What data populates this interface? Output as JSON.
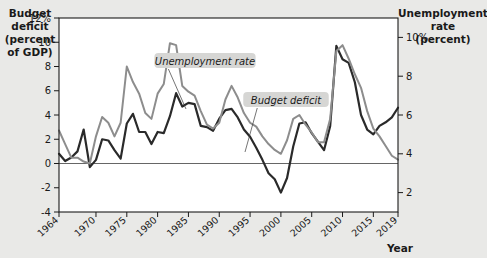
{
  "chart_data": {
    "type": "line",
    "title": "",
    "xlabel": "Year",
    "ylabel_left": "Budget deficit (percent of GDP)",
    "ylabel_right": "Unemployment rate (percent)",
    "xlim": [
      1964,
      2019
    ],
    "ylim_left": [
      -4,
      12
    ],
    "ylim_right": [
      1,
      11
    ],
    "grid": false,
    "legend_position": "inline-annotations",
    "x_tick_labels": [
      "1964",
      "1970",
      "1975",
      "1980",
      "1985",
      "1990",
      "1995",
      "2000",
      "2005",
      "2010",
      "2015",
      "2019"
    ],
    "x_tick_values": [
      1964,
      1970,
      1975,
      1980,
      1985,
      1990,
      1995,
      2000,
      2005,
      2010,
      2015,
      2019
    ],
    "y_left_tick_labels": [
      "12%",
      "10",
      "8",
      "6",
      "4",
      "2",
      "0",
      "-2",
      "-4"
    ],
    "y_left_tick_values": [
      12,
      10,
      8,
      6,
      4,
      2,
      0,
      -2,
      -4
    ],
    "y_right_tick_labels": [
      "10%",
      "8",
      "6",
      "4",
      "2"
    ],
    "y_right_tick_values": [
      10,
      8,
      6,
      4,
      2
    ],
    "x": [
      1964,
      1965,
      1966,
      1967,
      1968,
      1969,
      1970,
      1971,
      1972,
      1973,
      1974,
      1975,
      1976,
      1977,
      1978,
      1979,
      1980,
      1981,
      1982,
      1983,
      1984,
      1985,
      1986,
      1987,
      1988,
      1989,
      1990,
      1991,
      1992,
      1993,
      1994,
      1995,
      1996,
      1997,
      1998,
      1999,
      2000,
      2001,
      2002,
      2003,
      2004,
      2005,
      2006,
      2007,
      2008,
      2009,
      2010,
      2011,
      2012,
      2013,
      2014,
      2015,
      2016,
      2017,
      2018,
      2019
    ],
    "series": [
      {
        "name": "Budget deficit",
        "axis": "left",
        "units": "percent of GDP",
        "color": "#2a2a2a",
        "values": [
          0.8,
          0.2,
          0.5,
          1.0,
          2.8,
          -0.3,
          0.3,
          2.0,
          1.9,
          1.1,
          0.4,
          3.3,
          4.1,
          2.6,
          2.6,
          1.6,
          2.6,
          2.5,
          3.9,
          5.8,
          4.7,
          5.0,
          4.9,
          3.1,
          3.0,
          2.7,
          3.7,
          4.4,
          4.5,
          3.8,
          2.8,
          2.2,
          1.3,
          0.3,
          -0.8,
          -1.3,
          -2.4,
          -1.2,
          1.4,
          3.3,
          3.4,
          2.5,
          1.8,
          1.1,
          3.1,
          9.7,
          8.6,
          8.3,
          6.7,
          4.0,
          2.8,
          2.4,
          3.1,
          3.4,
          3.8,
          4.6
        ]
      },
      {
        "name": "Unemployment rate",
        "axis": "right",
        "units": "percent",
        "color": "#8d8d8d",
        "values": [
          5.2,
          4.5,
          3.8,
          3.8,
          3.6,
          3.5,
          4.9,
          5.9,
          5.6,
          4.9,
          5.6,
          8.5,
          7.7,
          7.1,
          6.1,
          5.8,
          7.1,
          7.6,
          9.7,
          9.6,
          7.5,
          7.2,
          7.0,
          6.2,
          5.5,
          5.3,
          5.6,
          6.8,
          7.5,
          6.9,
          6.1,
          5.6,
          5.4,
          4.9,
          4.5,
          4.2,
          4.0,
          4.7,
          5.8,
          6.0,
          5.5,
          5.1,
          4.6,
          4.6,
          5.8,
          9.3,
          9.6,
          8.9,
          8.1,
          7.4,
          6.2,
          5.3,
          4.9,
          4.4,
          3.9,
          3.7
        ]
      }
    ],
    "annotations": [
      {
        "text": "Unemployment rate",
        "target_year": 1983,
        "target_series": "Unemployment rate"
      },
      {
        "text": "Budget deficit",
        "target_year": 1996,
        "target_series": "Budget deficit"
      }
    ]
  },
  "colors": {
    "page_background": "#e9e9e7",
    "plot_background": "#ffffff",
    "frame": "#1a1a1a",
    "budget_deficit_line": "#2a2a2a",
    "unemployment_line": "#8d8d8d",
    "annotation_chip": "#d6d6d4"
  }
}
